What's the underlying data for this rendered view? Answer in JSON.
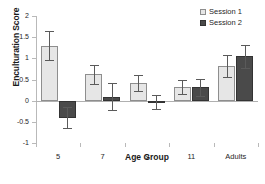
{
  "chart_data": {
    "type": "bar",
    "title": "",
    "xlabel": "Age Group",
    "ylabel": "Enculturation Score",
    "ylim": [
      -1,
      2
    ],
    "yticks": [
      2,
      1.5,
      1,
      0.5,
      0,
      -0.5,
      -1
    ],
    "ytick_labels": [
      "2",
      "1.5",
      "1",
      "0.5",
      "0",
      "-0.5",
      "-1"
    ],
    "grid": false,
    "legend_position": "top-right",
    "categories": [
      "5",
      "7",
      "9",
      "11",
      "Adults"
    ],
    "series": [
      {
        "name": "Session 1",
        "color": "#e6e6e6",
        "values": [
          1.3,
          0.62,
          0.41,
          0.32,
          0.82
        ],
        "error_low": [
          0.96,
          0.39,
          0.22,
          0.15,
          0.56
        ],
        "error_high": [
          1.64,
          0.85,
          0.6,
          0.5,
          1.07
        ]
      },
      {
        "name": "Session 2",
        "color": "#4a4a4a",
        "values": [
          -0.4,
          0.09,
          -0.03,
          0.32,
          1.05
        ],
        "error_low": [
          -0.65,
          -0.22,
          -0.2,
          0.12,
          0.78
        ],
        "error_high": [
          -0.15,
          0.41,
          0.13,
          0.51,
          1.32
        ]
      }
    ]
  },
  "legend": {
    "items": [
      {
        "label": "Session 1",
        "swatch": "light-gray-square"
      },
      {
        "label": "Session 2",
        "swatch": "dark-gray-square"
      }
    ]
  }
}
